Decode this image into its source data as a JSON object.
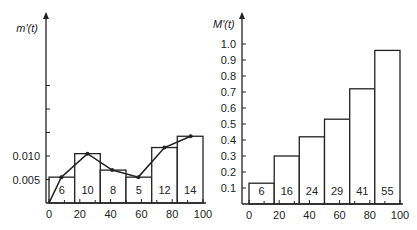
{
  "chart_data": [
    {
      "type": "bar",
      "title": "",
      "ylabel": "m'(t)",
      "xlabel": "",
      "bin_edges": [
        0,
        16.7,
        33.3,
        50,
        66.7,
        83.3,
        100
      ],
      "bar_heights": [
        0.0055,
        0.0105,
        0.007,
        0.0055,
        0.0118,
        0.0142
      ],
      "bar_labels": [
        "6",
        "10",
        "8",
        "5",
        "12",
        "14"
      ],
      "line_series": {
        "name": "m'(t) smoothed",
        "x": [
          0,
          8,
          25,
          41,
          58,
          75,
          92
        ],
        "y": [
          0,
          0.0055,
          0.0105,
          0.007,
          0.0055,
          0.0118,
          0.0142
        ]
      },
      "x_ticks": [
        "0",
        "20",
        "40",
        "60",
        "80",
        "100"
      ],
      "y_ticks": [
        "0.005",
        "0.010"
      ],
      "ylim": [
        0,
        0.03
      ],
      "xlim": [
        0,
        100
      ],
      "grid": false
    },
    {
      "type": "bar",
      "title": "",
      "ylabel": "M'(t)",
      "xlabel": "",
      "bin_edges": [
        0,
        16.7,
        33.3,
        50,
        66.7,
        83.3,
        100
      ],
      "bar_heights": [
        0.13,
        0.3,
        0.42,
        0.53,
        0.72,
        0.96
      ],
      "bar_labels": [
        "6",
        "16",
        "24",
        "29",
        "41",
        "55"
      ],
      "x_ticks": [
        "0",
        "20",
        "40",
        "60",
        "80",
        "100"
      ],
      "y_ticks": [
        "0.1",
        "0.2",
        "0.3",
        "0.4",
        "0.5",
        "0.6",
        "0.7",
        "0.8",
        "0.9",
        "1.0"
      ],
      "ylim": [
        0,
        1.05
      ],
      "xlim": [
        0,
        100
      ],
      "grid": false
    }
  ]
}
